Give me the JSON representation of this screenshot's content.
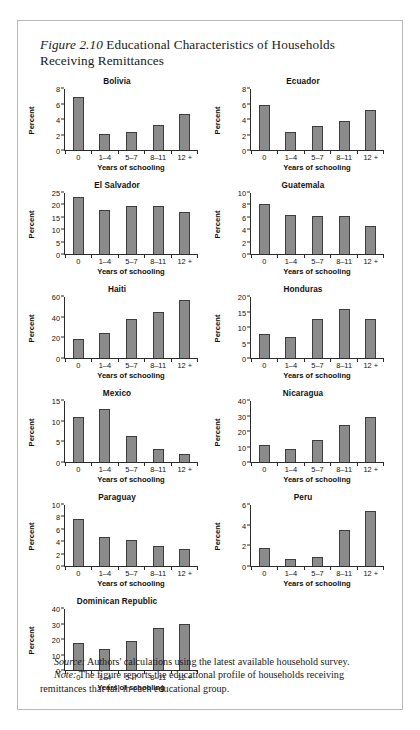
{
  "figure": {
    "label": "Figure 2.10",
    "title": "Educational Characteristics of Households Receiving Remittances",
    "source_lead": "Source:",
    "source_text": " Authors' calculations using the latest available household survey.",
    "note_lead": "Note:",
    "note_text": " The figure reports the educational profile of households receiving remittances that fall in each educational group."
  },
  "common": {
    "xlabel": "Years of schooling",
    "ylabel": "Percent",
    "categories": [
      "0",
      "1–4",
      "5–7",
      "8–11",
      "12 +"
    ],
    "bar_color": "#8b8b8b",
    "bar_border_color": "#3d3d3d",
    "axis_color": "#2b2b2b"
  },
  "chart_data": [
    {
      "type": "bar",
      "title": "Bolivia",
      "categories": [
        "0",
        "1–4",
        "5–7",
        "8–11",
        "12 +"
      ],
      "values": [
        6.9,
        2.1,
        2.3,
        3.3,
        4.7
      ],
      "xlabel": "Years of schooling",
      "ylabel": "Percent",
      "ylim": [
        0,
        8
      ],
      "yticks": [
        0,
        2,
        4,
        6,
        8
      ],
      "grid": false,
      "legend": "none"
    },
    {
      "type": "bar",
      "title": "Ecuador",
      "categories": [
        "0",
        "1–4",
        "5–7",
        "8–11",
        "12 +"
      ],
      "values": [
        5.9,
        2.3,
        3.1,
        3.8,
        5.2
      ],
      "xlabel": "Years of schooling",
      "ylabel": "Percent",
      "ylim": [
        0,
        8
      ],
      "yticks": [
        0,
        2,
        4,
        6,
        8
      ],
      "grid": false,
      "legend": "none"
    },
    {
      "type": "bar",
      "title": "El Salvador",
      "categories": [
        "0",
        "1–4",
        "5–7",
        "8–11",
        "12 +"
      ],
      "values": [
        23.2,
        18.0,
        19.8,
        19.6,
        17.3
      ],
      "xlabel": "Years of schooling",
      "ylabel": "Percent",
      "ylim": [
        0,
        25
      ],
      "yticks": [
        0,
        5,
        10,
        15,
        20,
        25
      ],
      "grid": false,
      "legend": "none"
    },
    {
      "type": "bar",
      "title": "Guatemala",
      "categories": [
        "0",
        "1–4",
        "5–7",
        "8–11",
        "12 +"
      ],
      "values": [
        8.2,
        6.4,
        6.2,
        6.3,
        4.6
      ],
      "xlabel": "Years of schooling",
      "ylabel": "Percent",
      "ylim": [
        0,
        10
      ],
      "yticks": [
        0,
        2,
        4,
        6,
        8,
        10
      ],
      "grid": false,
      "legend": "none"
    },
    {
      "type": "bar",
      "title": "Haiti",
      "categories": [
        "0",
        "1–4",
        "5–7",
        "8–11",
        "12 +"
      ],
      "values": [
        18.5,
        25.0,
        38.0,
        45.0,
        57.5
      ],
      "xlabel": "Years of schooling",
      "ylabel": "Percent",
      "ylim": [
        0,
        60
      ],
      "yticks": [
        0,
        20,
        40,
        60
      ],
      "grid": false,
      "legend": "none"
    },
    {
      "type": "bar",
      "title": "Honduras",
      "categories": [
        "0",
        "1–4",
        "5–7",
        "8–11",
        "12 +"
      ],
      "values": [
        8.0,
        7.0,
        12.8,
        16.0,
        12.8
      ],
      "xlabel": "Years of schooling",
      "ylabel": "Percent",
      "ylim": [
        0,
        20
      ],
      "yticks": [
        0,
        5,
        10,
        15,
        20
      ],
      "grid": false,
      "legend": "none"
    },
    {
      "type": "bar",
      "title": "Mexico",
      "categories": [
        "0",
        "1–4",
        "5–7",
        "8–11",
        "12 +"
      ],
      "values": [
        11.0,
        13.1,
        6.5,
        3.1,
        2.0
      ],
      "xlabel": "Years of schooling",
      "ylabel": "Percent",
      "ylim": [
        0,
        15
      ],
      "yticks": [
        0,
        5,
        10,
        15
      ],
      "grid": false,
      "legend": "none"
    },
    {
      "type": "bar",
      "title": "Nicaragua",
      "categories": [
        "0",
        "1–4",
        "5–7",
        "8–11",
        "12 +"
      ],
      "values": [
        11.0,
        8.3,
        14.6,
        24.2,
        29.4
      ],
      "xlabel": "Years of schooling",
      "ylabel": "Percent",
      "ylim": [
        0,
        40
      ],
      "yticks": [
        0,
        10,
        20,
        30,
        40
      ],
      "grid": false,
      "legend": "none"
    },
    {
      "type": "bar",
      "title": "Paraguay",
      "categories": [
        "0",
        "1–4",
        "5–7",
        "8–11",
        "12 +"
      ],
      "values": [
        7.7,
        4.8,
        4.3,
        3.2,
        2.8
      ],
      "xlabel": "Years of schooling",
      "ylabel": "Percent",
      "ylim": [
        0,
        10
      ],
      "yticks": [
        0,
        2,
        4,
        6,
        8,
        10
      ],
      "grid": false,
      "legend": "none"
    },
    {
      "type": "bar",
      "title": "Peru",
      "categories": [
        "0",
        "1–4",
        "5–7",
        "8–11",
        "12 +"
      ],
      "values": [
        1.8,
        0.7,
        0.9,
        3.5,
        5.4
      ],
      "xlabel": "Years of schooling",
      "ylabel": "Percent",
      "ylim": [
        0,
        6
      ],
      "yticks": [
        0,
        2,
        4,
        6
      ],
      "grid": false,
      "legend": "none"
    },
    {
      "type": "bar",
      "title": "Dominican Republic",
      "categories": [
        "0",
        "1–4",
        "5–7",
        "8–11",
        "12 +"
      ],
      "values": [
        18.0,
        14.0,
        19.3,
        27.6,
        30.2
      ],
      "xlabel": "Years of schooling",
      "ylabel": "Percent",
      "ylim": [
        0,
        40
      ],
      "yticks": [
        0,
        10,
        20,
        30,
        40
      ],
      "grid": false,
      "legend": "none"
    }
  ]
}
